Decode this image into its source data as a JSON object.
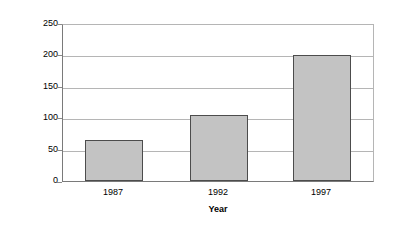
{
  "chart_data": {
    "type": "bar",
    "title": "",
    "categories": [
      "1987",
      "1992",
      "1997"
    ],
    "values": [
      65,
      105,
      202
    ],
    "series": [
      {
        "name": "Small Exporting Businesses",
        "values": [
          65,
          105,
          202
        ]
      }
    ],
    "xlabel": "Year",
    "ylabel": "Small Exporting Businesses (thousands)",
    "ylim": [
      0,
      250
    ],
    "ytick_labels": [
      "250",
      "200",
      "150",
      "100",
      "50",
      "0"
    ],
    "ytick_values": [
      250,
      200,
      150,
      100,
      50,
      0
    ],
    "grid": true,
    "grid_axis": "y",
    "legend": false,
    "legend_position": "none",
    "colors": {
      "bar_fill": "#c3c3c3",
      "bar_border": "#4c4c4c",
      "gridline": "#b5b5b5",
      "axis": "#7a7a7a",
      "text": "#000000",
      "background": "#ffffff"
    }
  }
}
